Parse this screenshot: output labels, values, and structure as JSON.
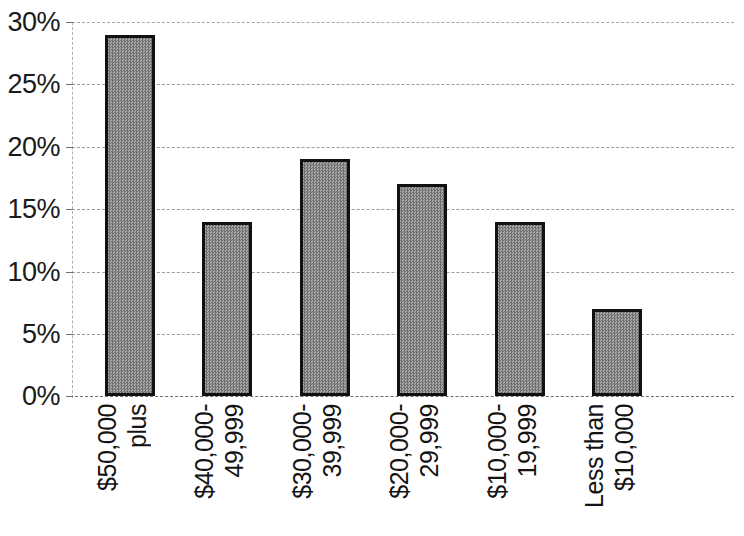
{
  "chart_data": {
    "type": "bar",
    "title": "",
    "subtitle": "",
    "xlabel": "",
    "ylabel": "",
    "grid": true,
    "legend": false,
    "legend_position": "none",
    "ylim": [
      0,
      30
    ],
    "ytick_step": 5,
    "categories": [
      "$50,000 plus",
      "$40,000-49,999",
      "$30,000-39,999",
      "$20,000-29,999",
      "$10,000-19,999",
      "Less than $10,000"
    ],
    "category_lines": [
      [
        "$50,000",
        "plus"
      ],
      [
        "$40,000-",
        "49,999"
      ],
      [
        "$30,000-",
        "39,999"
      ],
      [
        "$20,000-",
        "29,999"
      ],
      [
        "$10,000-",
        "19,999"
      ],
      [
        "Less than",
        "$10,000"
      ]
    ],
    "values": [
      29,
      14,
      19,
      17,
      14,
      7
    ],
    "value_labels": [
      "29%",
      "14%",
      "19%",
      "17%",
      "14%",
      "7%"
    ],
    "ytick_labels": [
      "30%",
      "25%",
      "20%",
      "15%",
      "10%",
      "5%",
      "0%"
    ],
    "ytick_values": [
      30,
      25,
      20,
      15,
      10,
      5,
      0
    ],
    "colors": {
      "bar_fill": "#8a8a8a",
      "bar_border": "#111111",
      "gridline": "#9a9a9a",
      "text": "#131313",
      "background": "#ffffff"
    }
  }
}
